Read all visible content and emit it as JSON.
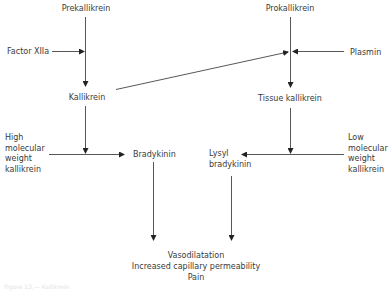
{
  "diagram": {
    "type": "flowchart",
    "nodes": {
      "prekallikrein": "Prekallikrein",
      "factor_xiia": "Factor XIIa",
      "kallikrein": "Kallikrein",
      "high_mw_kallikrein": "High\nmolecular\nweight\nkallikrein",
      "bradykinin": "Bradykinin",
      "prokallikrein": "Prokallikrein",
      "plasmin": "Plasmin",
      "tissue_kallikrein": "Tissue kallikrein",
      "low_mw_kallikrein": "Low\nmolecular\nweight\nkallikrein",
      "lysyl_bradykinin": "Lysyl\nbradykinin",
      "effects": "Vasodilatation\nIncreased capillary permeability\nPain"
    },
    "edges": [
      {
        "from": "Prekallikrein",
        "to": "Kallikrein"
      },
      {
        "from": "Factor XIIa",
        "to": "Prekallikrein→Kallikrein"
      },
      {
        "from": "Prokallikrein",
        "to": "Tissue kallikrein"
      },
      {
        "from": "Plasmin",
        "to": "Prokallikrein→Tissue kallikrein"
      },
      {
        "from": "Kallikrein",
        "to": "Prokallikrein→Tissue kallikrein"
      },
      {
        "from": "High molecular weight kallikrein",
        "to": "Bradykinin"
      },
      {
        "from": "Kallikrein",
        "to": "High molecular weight kallikrein→Bradykinin"
      },
      {
        "from": "Low molecular weight kallikrein",
        "to": "Lysyl bradykinin"
      },
      {
        "from": "Tissue kallikrein",
        "to": "Low molecular weight kallikrein→Lysyl bradykinin"
      },
      {
        "from": "Bradykinin",
        "to": "Vasodilatation / Increased capillary permeability / Pain"
      },
      {
        "from": "Lysyl bradykinin",
        "to": "Vasodilatation / Increased capillary permeability / Pain"
      }
    ],
    "line_color": "#333333",
    "caption": "Figure 13.— Kallikrein"
  }
}
